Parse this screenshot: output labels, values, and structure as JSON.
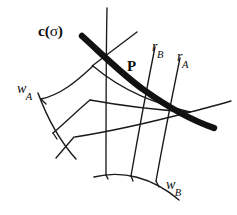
{
  "figure": {
    "background_color": "#ffffff",
    "ink_color": "#1a1a1a",
    "width": 237,
    "height": 215
  },
  "labels": {
    "curve": {
      "name": "c-sigma-label",
      "base": "c(",
      "sigma": "σ",
      "close": ")",
      "full_text": "c(σ)",
      "style": "bold-upright"
    },
    "point": {
      "name": "point-p-label",
      "text": "P",
      "style": "bold-upright"
    },
    "ray_b": {
      "name": "ray-rb-label",
      "base": "r",
      "subscript": "B",
      "full_text": "rB",
      "style": "italic"
    },
    "ray_a": {
      "name": "ray-ra-label",
      "base": "r",
      "subscript": "A",
      "full_text": "rA",
      "style": "italic"
    },
    "wall_a": {
      "name": "wall-wa-label",
      "base": "w",
      "subscript": "A",
      "full_text": "wA",
      "style": "italic"
    },
    "wall_b": {
      "name": "wall-wb-label",
      "base": "w",
      "subscript": "B",
      "full_text": "wB",
      "style": "italic"
    }
  },
  "geometry": {
    "thick_curve": {
      "name": "c-sigma-curve",
      "stroke_width": 6.4,
      "path": "M 82 36 C 104 56 123 75 144 90 C 165 105 188 119 214 128"
    },
    "arcs": [
      {
        "name": "wall-a-arc",
        "path": "M 38 93 C 45 112 57 138 76 159"
      },
      {
        "name": "wall-b-arc",
        "path": "M 94 177 C 122 170 152 177 179 200"
      }
    ],
    "lines": [
      {
        "name": "mesh-line-vertical-center",
        "path": "M 107 8 C 106 55 106 115 106 175"
      },
      {
        "name": "mesh-line-diagonal-top-right",
        "path": "M 137 32 L 92 66"
      },
      {
        "name": "mesh-line-ray-b",
        "path": "M 155 47 C 147 87 139 130 131 176"
      },
      {
        "name": "mesh-line-ray-a",
        "path": "M 180 58 C 172 97 164 137 156 181"
      },
      {
        "name": "mesh-line-upper-left-spoke",
        "path": "M 93 66 C 76 82 60 95 41 99"
      },
      {
        "name": "mesh-line-mid-left-spoke",
        "path": "M 90 100 C 78 110 66 122 53 133"
      },
      {
        "name": "mesh-line-lower-left-spoke",
        "path": "M 74 137 C 68 144 62 151 56 158"
      },
      {
        "name": "mesh-line-radial-upper",
        "path": "M 190 112 C 158 104 125 93 93 66"
      },
      {
        "name": "mesh-line-radial-mid",
        "path": "M 190 112 C 157 110 123 106 90 100"
      },
      {
        "name": "mesh-line-radial-lower",
        "path": "M 190 112 C 152 122 113 131 75 137"
      },
      {
        "name": "mesh-line-radial-far",
        "path": "M 190 112 C 203 109 217 105 231 101"
      },
      {
        "name": "mesh-line-left-rib-upper",
        "path": "M 41 99 L 46 104"
      },
      {
        "name": "mesh-line-left-rib-lower",
        "path": "M 53 133 L 57 139"
      },
      {
        "name": "mesh-line-bottom-rib-center",
        "path": "M 106 175 L 108 179"
      },
      {
        "name": "mesh-line-bottom-rib-b",
        "path": "M 131 176 L 133 181"
      },
      {
        "name": "mesh-line-bottom-rib-a",
        "path": "M 156 181 L 159 187"
      }
    ]
  }
}
